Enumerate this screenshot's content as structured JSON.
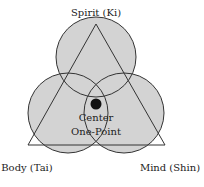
{
  "diagram": {
    "labels": {
      "top": "Spirit (Ki)",
      "left": "Body (Tai)",
      "right": "Mind (Shin)",
      "center_line1": "Center",
      "center_line2": "One-Point"
    },
    "colors": {
      "circle_fill": "#d3d3d3",
      "stroke": "#333333",
      "dot": "#111111",
      "background": "#ffffff"
    },
    "circles": [
      {
        "name": "spirit",
        "cx": 96,
        "cy": 57,
        "r": 40
      },
      {
        "name": "body",
        "cx": 68,
        "cy": 113,
        "r": 40
      },
      {
        "name": "mind",
        "cx": 124,
        "cy": 113,
        "r": 40
      }
    ],
    "triangle": {
      "apex": [
        96,
        24
      ],
      "left": [
        28,
        145
      ],
      "right": [
        165,
        145
      ]
    },
    "center_dot": {
      "cx": 96,
      "cy": 104,
      "r": 5
    }
  }
}
